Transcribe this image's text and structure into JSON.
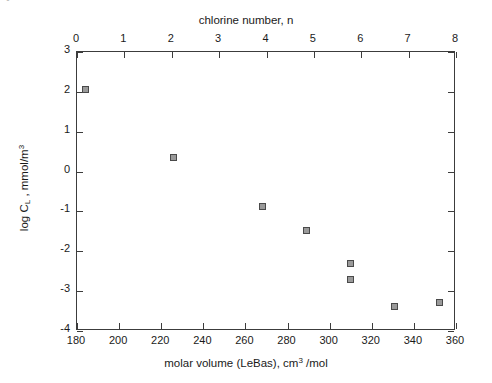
{
  "artifact": {
    "text": "•"
  },
  "chart_data": {
    "type": "scatter",
    "title": "",
    "xlabel": "molar volume (LeBas), cm3 /mol",
    "xlabel_parts": {
      "pre": "molar volume (LeBas), cm",
      "sup": "3",
      "post": " /mol"
    },
    "ylabel": "log CL , mmol/m3",
    "ylabel_parts": {
      "pre": "log C",
      "sub": "L",
      "mid": " , mmol/m",
      "sup": "3"
    },
    "top_axis_label": "chlorine number, n",
    "xlim": [
      180,
      360
    ],
    "ylim": [
      -4,
      3
    ],
    "top_xlim": [
      0,
      8
    ],
    "xticks": [
      180,
      200,
      220,
      240,
      260,
      280,
      300,
      320,
      340,
      360
    ],
    "xticklabels": [
      "180",
      "200",
      "220",
      "240",
      "260",
      "280",
      "300",
      "320",
      "340",
      "360"
    ],
    "yticks": [
      3,
      2,
      1,
      0,
      -1,
      -2,
      -3,
      -4
    ],
    "yticklabels": [
      "3",
      "2",
      "1",
      "0",
      "-1",
      "-2",
      "-3",
      "-4"
    ],
    "top_xticks": [
      0,
      1,
      2,
      3,
      4,
      5,
      6,
      7,
      8
    ],
    "top_xticklabels": [
      "0",
      "1",
      "2",
      "3",
      "4",
      "5",
      "6",
      "7",
      "8"
    ],
    "grid": false,
    "legend": null,
    "marker": "square",
    "marker_color": "#9a9a9a",
    "marker_edge_color": "#4a4a4a",
    "axis_color": "#3c3c3c",
    "points": [
      {
        "x": 184,
        "y": 2.07,
        "n": 0
      },
      {
        "x": 226,
        "y": 0.36,
        "n": 2
      },
      {
        "x": 268,
        "y": -0.87,
        "n": 4
      },
      {
        "x": 289,
        "y": -1.47,
        "n": 5
      },
      {
        "x": 310,
        "y": -2.3,
        "n": 6
      },
      {
        "x": 310,
        "y": -2.7,
        "n": 6
      },
      {
        "x": 331,
        "y": -3.38,
        "n": 7
      },
      {
        "x": 352,
        "y": -3.28,
        "n": 8
      }
    ]
  }
}
